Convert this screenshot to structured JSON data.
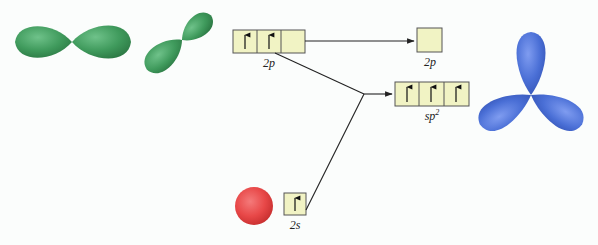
{
  "colors": {
    "p_orbital": "#3f9a5c",
    "s_orbital": "#e84848",
    "sp2_orbital": "#4a6fd6",
    "box_fill": "#f1f3c4",
    "box_stroke": "#555555",
    "line": "#222222"
  },
  "labels": {
    "p2_left": "2p",
    "p2_right": "2p",
    "sp2": "sp",
    "sp2_sup": "2",
    "s2": "2s"
  },
  "boxes": {
    "p2_left": {
      "cells": 3,
      "electrons": [
        "up",
        "up",
        "empty"
      ]
    },
    "p2_right": {
      "cells": 1,
      "electrons": [
        "empty"
      ]
    },
    "sp2": {
      "cells": 3,
      "electrons": [
        "up",
        "up",
        "up"
      ]
    },
    "s2": {
      "cells": 1,
      "electrons": [
        "up"
      ]
    }
  },
  "orbitals": [
    {
      "name": "p-orbital-horizontal",
      "type": "p"
    },
    {
      "name": "p-orbital-tilted",
      "type": "p"
    },
    {
      "name": "s-orbital",
      "type": "s"
    },
    {
      "name": "sp2-hybrid-orbitals",
      "type": "sp2"
    }
  ]
}
